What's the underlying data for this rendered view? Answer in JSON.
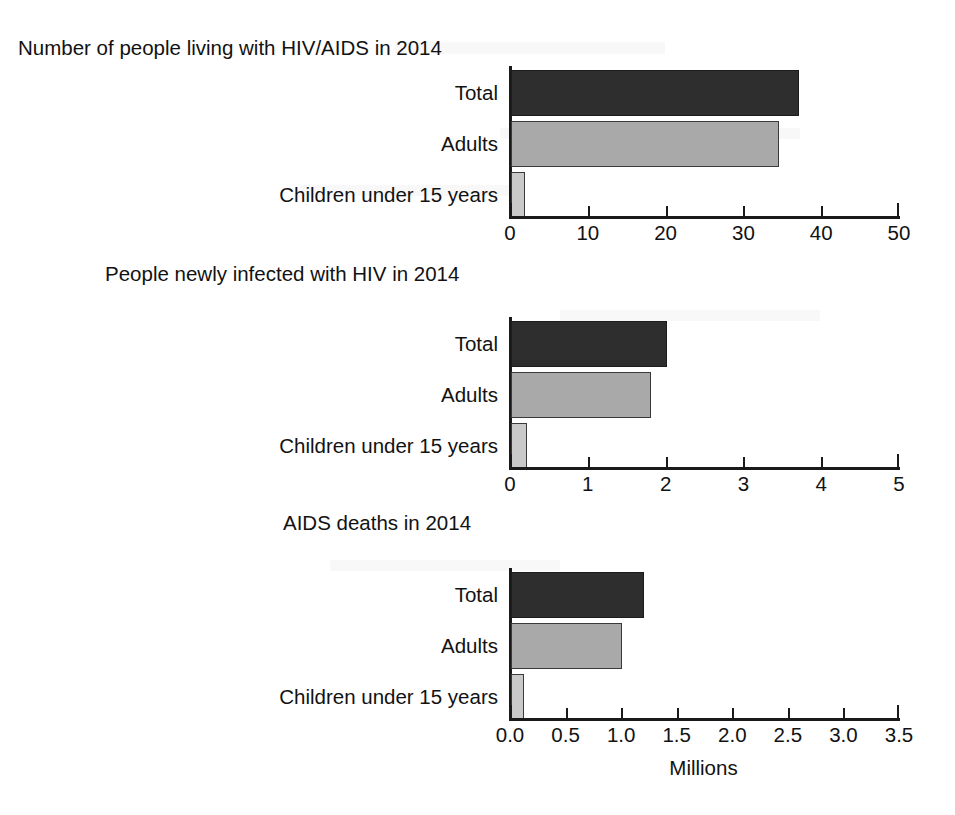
{
  "figure": {
    "units_label": "Millions",
    "categories": [
      "Total",
      "Adults",
      "Children under 15 years"
    ],
    "colors": {
      "total": "#2e2e2e",
      "adults": "#a9a9a9",
      "children": "#c9c9c9",
      "axis": "#1a1a1a",
      "background": "#ffffff"
    }
  },
  "chart_data": [
    {
      "type": "bar",
      "orientation": "horizontal",
      "title": "Number of people living with HIV/AIDS in 2014",
      "categories": [
        "Total",
        "Adults",
        "Children under 15 years"
      ],
      "values": [
        37.0,
        34.5,
        1.8
      ],
      "xlabel": "Millions",
      "ylabel": "",
      "xlim": [
        0,
        50
      ],
      "xticks": [
        0,
        10,
        20,
        30,
        40,
        50
      ],
      "xticklabels": [
        "0",
        "10",
        "20",
        "30",
        "40",
        "50"
      ],
      "grid": false,
      "legend": "none"
    },
    {
      "type": "bar",
      "orientation": "horizontal",
      "title": "People newly infected with HIV in 2014",
      "categories": [
        "Total",
        "Adults",
        "Children under 15 years"
      ],
      "values": [
        2.0,
        1.8,
        0.2
      ],
      "xlabel": "Millions",
      "ylabel": "",
      "xlim": [
        0,
        5
      ],
      "xticks": [
        0,
        1,
        2,
        3,
        4,
        5
      ],
      "xticklabels": [
        "0",
        "1",
        "2",
        "3",
        "4",
        "5"
      ],
      "grid": false,
      "legend": "none"
    },
    {
      "type": "bar",
      "orientation": "horizontal",
      "title": "AIDS deaths in 2014",
      "categories": [
        "Total",
        "Adults",
        "Children under 15 years"
      ],
      "values": [
        1.2,
        1.0,
        0.12
      ],
      "xlabel": "Millions",
      "ylabel": "",
      "xlim": [
        0.0,
        3.5
      ],
      "xticks": [
        0.0,
        0.5,
        1.0,
        1.5,
        2.0,
        2.5,
        3.0,
        3.5
      ],
      "xticklabels": [
        "0.0",
        "0.5",
        "1.0",
        "1.5",
        "2.0",
        "2.5",
        "3.0",
        "3.5"
      ],
      "grid": false,
      "legend": "none"
    }
  ]
}
